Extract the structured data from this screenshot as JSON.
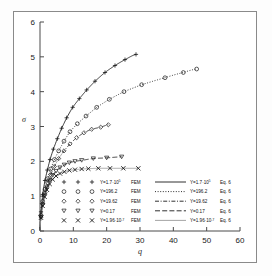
{
  "chart_data": {
    "type": "line",
    "title": "",
    "xlabel": "q",
    "ylabel": "σ",
    "xlim": [
      0,
      60
    ],
    "ylim": [
      0,
      6
    ],
    "xticks": [
      "0",
      "10",
      "20",
      "30",
      "40",
      "50",
      "60"
    ],
    "xtick_values": [
      0,
      10,
      20,
      30,
      40,
      50,
      60
    ],
    "yticks": [
      "0",
      "1",
      "2",
      "3",
      "4",
      "5",
      "6"
    ],
    "ytick_values": [
      0,
      1,
      2,
      3,
      4,
      5,
      6
    ],
    "grid": false,
    "legend_position": "inside-bottom",
    "series": [
      {
        "name": "Y=1.7·10⁵ FEM",
        "marker": "plus",
        "color": "#1a1a1a",
        "x": [
          0.3,
          0.8,
          1.5,
          2.2,
          3.0,
          4.0,
          5.2,
          6.5,
          8.0,
          9.8,
          11.8,
          14.0,
          16.5,
          19.5,
          22.5,
          25.5,
          28.8
        ],
        "y": [
          0.55,
          1.05,
          1.45,
          1.75,
          2.05,
          2.35,
          2.65,
          2.95,
          3.25,
          3.55,
          3.8,
          4.05,
          4.3,
          4.55,
          4.75,
          4.92,
          5.07
        ]
      },
      {
        "name": "Y=196.2 FEM",
        "marker": "circle",
        "color": "#1a1a1a",
        "x": [
          0.3,
          0.8,
          1.5,
          2.3,
          3.2,
          4.3,
          5.6,
          7.2,
          9.0,
          11.2,
          13.8,
          17.0,
          20.8,
          25.2,
          30.5,
          37.5,
          43.0,
          47.0
        ],
        "y": [
          0.45,
          0.85,
          1.2,
          1.5,
          1.78,
          2.05,
          2.3,
          2.58,
          2.85,
          3.08,
          3.3,
          3.55,
          3.78,
          4.0,
          4.2,
          4.4,
          4.55,
          4.65
        ]
      },
      {
        "name": "Y=19.62 FEM",
        "marker": "diamond",
        "color": "#1a1a1a",
        "x": [
          0.3,
          0.8,
          1.5,
          2.3,
          3.2,
          4.3,
          5.6,
          7.2,
          9.0,
          11.0,
          13.2,
          15.5,
          18.2,
          20.5
        ],
        "y": [
          0.4,
          0.78,
          1.1,
          1.38,
          1.62,
          1.85,
          2.08,
          2.3,
          2.5,
          2.68,
          2.82,
          2.92,
          2.98,
          3.05
        ]
      },
      {
        "name": "Y=0.17 FEM",
        "marker": "triangle-down",
        "color": "#1a1a1a",
        "x": [
          0.3,
          0.8,
          1.4,
          2.1,
          2.9,
          3.8,
          4.8,
          6.0,
          7.3,
          8.8,
          10.5,
          12.5,
          16.0,
          20.0,
          24.5
        ],
        "y": [
          0.4,
          0.75,
          1.02,
          1.25,
          1.45,
          1.6,
          1.72,
          1.82,
          1.9,
          1.96,
          2.0,
          2.03,
          2.08,
          2.1,
          2.13
        ]
      },
      {
        "name": "Y=1.96·10⁻⁷ FEM",
        "marker": "cross",
        "color": "#1a1a1a",
        "x": [
          0.3,
          0.8,
          1.4,
          2.1,
          2.9,
          3.8,
          4.8,
          6.0,
          7.3,
          8.8,
          10.5,
          12.5,
          14.5,
          17.5,
          21.0,
          25.0,
          29.5
        ],
        "y": [
          0.38,
          0.72,
          0.98,
          1.18,
          1.35,
          1.48,
          1.58,
          1.65,
          1.7,
          1.74,
          1.76,
          1.78,
          1.79,
          1.8,
          1.8,
          1.8,
          1.8
        ]
      }
    ],
    "fit_curves": [
      {
        "name": "Y=1.7·10⁵ Eq. 6",
        "style": "solid",
        "color": "#1a1a1a"
      },
      {
        "name": "Y=196.2 Eq. 6",
        "style": "dotted",
        "color": "#1a1a1a"
      },
      {
        "name": "Y=19.62 Eq. 6",
        "style": "dashdot",
        "color": "#1a1a1a"
      },
      {
        "name": "Y=0.17 Eq. 6",
        "style": "dashed",
        "color": "#1a1a1a"
      },
      {
        "name": "Y=1.96·10⁻⁷ Eq. 6",
        "style": "solid-gray",
        "color": "#9a9a9a"
      }
    ]
  },
  "axes": {
    "y_label": "σ",
    "x_label": "q",
    "x_ticks": [
      "0",
      "10",
      "20",
      "30",
      "40",
      "50",
      "60"
    ],
    "y_ticks": [
      "0",
      "1",
      "2",
      "3",
      "4",
      "5",
      "6"
    ]
  },
  "legend_markers": [
    {
      "symbol": "+",
      "base": "Y=1.7·10",
      "exp": "5",
      "method": "FEM"
    },
    {
      "symbol": "○",
      "base": "Y=196.2",
      "exp": "",
      "method": "FEM"
    },
    {
      "symbol": "◇",
      "base": "Y=19.62",
      "exp": "",
      "method": "FEM"
    },
    {
      "symbol": "▽",
      "base": "Y=0.17",
      "exp": "",
      "method": "FEM"
    },
    {
      "symbol": "×",
      "base": "Y=1.96·10",
      "exp": "-7",
      "method": "FEM"
    }
  ],
  "legend_lines": [
    {
      "style": "solid",
      "base": "Y=1.7·10",
      "exp": "5",
      "method": "Eq. 6"
    },
    {
      "style": "dotted",
      "base": "Y=196.2",
      "exp": "",
      "method": "Eq. 6"
    },
    {
      "style": "dashdot",
      "base": "Y=19.62",
      "exp": "",
      "method": "Eq. 6"
    },
    {
      "style": "dashed",
      "base": "Y=0.17",
      "exp": "",
      "method": "Eq. 6"
    },
    {
      "style": "solid-gray",
      "base": "Y=1.96·10",
      "exp": "-7",
      "method": "Eq. 6"
    }
  ],
  "colors": {
    "axis": "#4a4a4a",
    "frame": "#8a8a8a",
    "data": "#1a1a1a",
    "gray_series": "#9a9a9a",
    "background": "#ffffff"
  }
}
